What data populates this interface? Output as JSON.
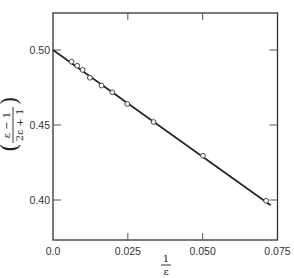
{
  "chart_data": {
    "type": "scatter",
    "title": "",
    "xlabel": "1/ε",
    "xlabel_parts": {
      "numerator": "1",
      "denominator": "ε"
    },
    "ylabel": "(ε − 1)/(2ε + 1)",
    "ylabel_parts": {
      "numerator": "ε − 1",
      "denominator": "2ε + 1"
    },
    "xlim": [
      0.0,
      0.075
    ],
    "ylim": [
      0.375,
      0.525
    ],
    "x_ticks": [
      0.0,
      0.025,
      0.05,
      0.075
    ],
    "x_tick_labels": [
      "0.0",
      "0.025",
      "0.050",
      "0.075"
    ],
    "y_ticks": [
      0.4,
      0.45,
      0.5
    ],
    "y_tick_labels": [
      "0.40",
      "0.45",
      "0.50"
    ],
    "grid": false,
    "legend": null,
    "series": [
      {
        "name": "measured",
        "marker": "open-circle",
        "x": [
          0.0062,
          0.0081,
          0.0099,
          0.0123,
          0.0162,
          0.0198,
          0.0248,
          0.0336,
          0.0501,
          0.0712
        ],
        "y": [
          0.4922,
          0.4895,
          0.4867,
          0.4815,
          0.4763,
          0.4718,
          0.464,
          0.452,
          0.4295,
          0.3995
        ]
      },
      {
        "name": "linear fit",
        "marker": "line",
        "x": [
          0.0,
          0.0727
        ],
        "y": [
          0.5,
          0.3965
        ]
      }
    ]
  }
}
